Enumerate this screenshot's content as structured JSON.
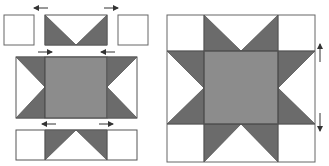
{
  "diagram": {
    "colors": {
      "background": "#ffffff",
      "outline": "#555555",
      "dark_triangle": "#6b6b6b",
      "center_square": "#8c8c8c",
      "arrow": "#333333"
    },
    "left_panel": {
      "description": "Block pieces laid out in rows with pressing arrows",
      "rows": [
        {
          "name": "top-row",
          "pieces": [
            "corner-square",
            "flying-geese-unit",
            "corner-square"
          ],
          "arrows": [
            "left",
            "right"
          ]
        },
        {
          "name": "middle-row",
          "pieces": [
            "flying-geese-unit-vertical",
            "center-square",
            "flying-geese-unit-vertical"
          ],
          "arrows": [
            "right",
            "left"
          ]
        },
        {
          "name": "bottom-row",
          "pieces": [
            "corner-square",
            "flying-geese-unit",
            "corner-square"
          ],
          "arrows": [
            "left",
            "right"
          ]
        }
      ]
    },
    "right_panel": {
      "description": "Completed Sawtooth Star block",
      "arrows": [
        "up",
        "down"
      ]
    }
  }
}
